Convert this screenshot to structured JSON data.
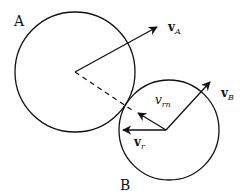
{
  "diagram": {
    "bodies": [
      {
        "id": "A",
        "label": "A",
        "cx": 75,
        "cy": 72,
        "r": 60,
        "label_x": 14,
        "label_y": 26
      },
      {
        "id": "B",
        "label": "B",
        "cx": 169,
        "cy": 130,
        "r": 50,
        "label_x": 120,
        "label_y": 190
      }
    ],
    "vectors": [
      {
        "id": "vA",
        "label_main": "v",
        "label_sub": "A",
        "x1": 75,
        "y1": 72,
        "x2": 157,
        "y2": 27,
        "label_x": 168,
        "label_y": 31,
        "bold": true
      },
      {
        "id": "vB",
        "label_main": "v",
        "label_sub": "B",
        "x1": 166,
        "y1": 130,
        "x2": 210,
        "y2": 82,
        "label_x": 221,
        "label_y": 97,
        "bold": true
      },
      {
        "id": "vrn",
        "label_main": "v",
        "label_sub": "rn",
        "x1": 166,
        "y1": 130,
        "x2": 138,
        "y2": 113,
        "label_x": 155,
        "label_y": 104,
        "bold": false
      },
      {
        "id": "vr",
        "label_main": "v",
        "label_sub": "r",
        "x1": 166,
        "y1": 130,
        "x2": 123,
        "y2": 130,
        "label_x": 134,
        "label_y": 146,
        "bold": true
      }
    ],
    "dashed_line": {
      "x1": 75,
      "y1": 72,
      "x2": 135,
      "y2": 112
    },
    "stroke_color": "#111111",
    "background": "#ffffff"
  }
}
